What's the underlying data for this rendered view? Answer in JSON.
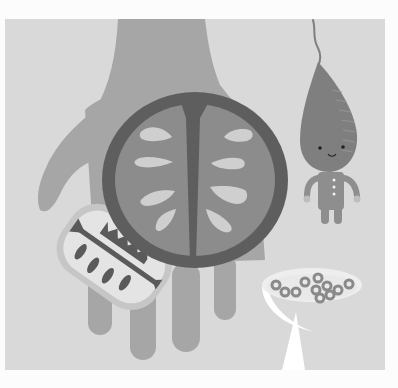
{
  "illustration": {
    "description": "Grayscale illustration of a large hand holding a halved fruit, a smaller sliced fruit, a root-vegetable character, and a bowl of cereal rings",
    "elements": {
      "hand": "hand",
      "large_fruit": "halved-fruit",
      "small_fruit": "fruit-slice",
      "character": "root-vegetable-character",
      "bowl": "cereal-bowl"
    }
  },
  "colors": {
    "page_background": "#fcfcfc",
    "panel_background": "#d9d9d9",
    "hand": "#a6a6a6",
    "fruit_rind": "#5e5e5e",
    "fruit_flesh": "#8c8c8c",
    "fruit_seeds": "#cfcfcf",
    "small_fruit_rind": "#c6c6c6",
    "small_fruit_flesh": "#e4e4e4",
    "small_fruit_dark": "#5a5a5a",
    "character_body": "#7f7f7f",
    "character_limbs": "#8e8e8e",
    "character_hands": "#bdbdbd",
    "bowl": "#ffffff",
    "milk": "#e9e9e9",
    "cereal": "#8a8a8a"
  }
}
